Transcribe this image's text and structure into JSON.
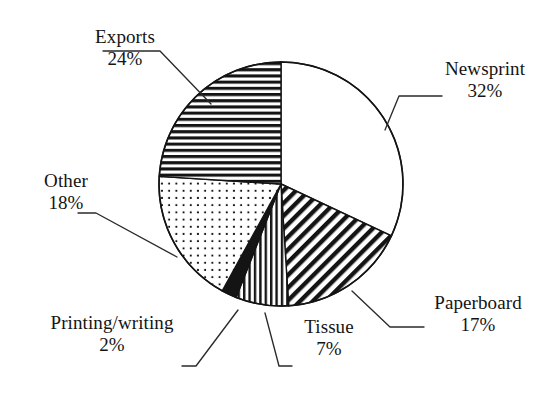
{
  "figure": {
    "background_color": "#ffffff",
    "ink_color": "#141414"
  },
  "chart_data": {
    "type": "pie",
    "title": "",
    "subtitle": "",
    "xlabel": "",
    "ylabel": "",
    "legend_position": "none",
    "grid": false,
    "units": "percent",
    "start_angle_deg": 0,
    "direction": "clockwise",
    "center": {
      "x": 281,
      "y": 184
    },
    "radius": 122,
    "categories": [
      "Newsprint",
      "Paperboard",
      "Tissue",
      "Printing/writing",
      "Other",
      "Exports"
    ],
    "values": [
      32,
      17,
      7,
      2,
      18,
      24
    ],
    "labels": [
      "32%",
      "17%",
      "7%",
      "2%",
      "18%",
      "24%"
    ],
    "slices": [
      {
        "name": "Newsprint",
        "value": 32,
        "value_label": "32%",
        "fill": "blank",
        "fill_color": "#ffffff",
        "start_deg": 0,
        "end_deg": 115.2,
        "leader_anchor_deg": 57.6
      },
      {
        "name": "Paperboard",
        "value": 17,
        "value_label": "17%",
        "fill": "diagonal-stripes",
        "fill_color": "#141414",
        "start_deg": 115.2,
        "end_deg": 176.4,
        "leader_anchor_deg": 145.8
      },
      {
        "name": "Tissue",
        "value": 7,
        "value_label": "7%",
        "fill": "vertical-stripes",
        "fill_color": "#141414",
        "start_deg": 176.4,
        "end_deg": 201.6,
        "leader_anchor_deg": 189.0
      },
      {
        "name": "Printing/writing",
        "value": 2,
        "value_label": "2%",
        "fill": "solid",
        "fill_color": "#141414",
        "start_deg": 201.6,
        "end_deg": 208.8,
        "leader_anchor_deg": 205.2
      },
      {
        "name": "Other",
        "value": 18,
        "value_label": "18%",
        "fill": "dots",
        "fill_color": "#141414",
        "start_deg": 208.8,
        "end_deg": 273.6,
        "leader_anchor_deg": 241.2
      },
      {
        "name": "Exports",
        "value": 24,
        "value_label": "24%",
        "fill": "horizontal-stripes",
        "fill_color": "#141414",
        "start_deg": 273.6,
        "end_deg": 360.0,
        "leader_anchor_deg": 316.8
      }
    ]
  },
  "labels": {
    "newsprint": {
      "name": "Newsprint",
      "pct": "32%"
    },
    "paperboard": {
      "name": "Paperboard",
      "pct": "17%"
    },
    "tissue": {
      "name": "Tissue",
      "pct": "7%"
    },
    "printing_writing": {
      "name": "Printing/writing",
      "pct": "2%"
    },
    "other": {
      "name": "Other",
      "pct": "18%"
    },
    "exports": {
      "name": "Exports",
      "pct": "24%"
    }
  }
}
